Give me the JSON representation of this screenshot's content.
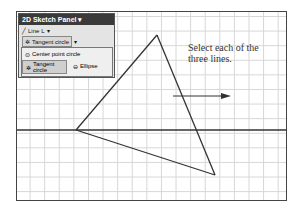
{
  "panel": {
    "title": "2D Sketch Panel ▾",
    "line_label": "Line",
    "line_shortcut": "L",
    "tool_label": "Tangent circle"
  },
  "menu": {
    "items": [
      {
        "label": "Center point circle"
      },
      {
        "label": "Tangent circle"
      },
      {
        "label": "Ellipse"
      }
    ]
  },
  "instruction": {
    "line1": "Select each of the",
    "line2": "three lines."
  },
  "geometry": {
    "horizontal_line_y": 130,
    "triangle": [
      [
        76,
        130
      ],
      [
        157,
        35
      ],
      [
        215,
        175
      ]
    ],
    "arrow": {
      "x1": 173,
      "x2": 230,
      "y": 96
    }
  }
}
